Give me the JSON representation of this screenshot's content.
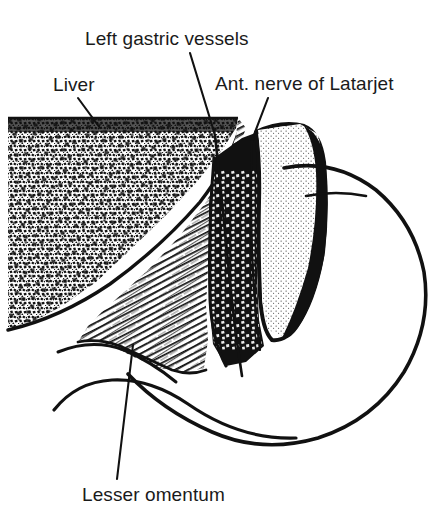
{
  "figure": {
    "background_color": "#ffffff",
    "ink_color": "#111111",
    "label_color": "#1a1a1a",
    "width": 441,
    "height": 514
  },
  "labels": [
    {
      "id": "left-gastric-vessels",
      "text": "Left gastric vessels",
      "x": 85,
      "y": 45,
      "leader": {
        "x1": 190,
        "y1": 53,
        "x2": 215,
        "y2": 135
      }
    },
    {
      "id": "liver",
      "text": "Liver",
      "x": 53,
      "y": 91,
      "leader": {
        "x1": 78,
        "y1": 98,
        "x2": 100,
        "y2": 128
      }
    },
    {
      "id": "ant-nerve-of-latarjet",
      "text": "Ant. nerve of Latarjet",
      "x": 215,
      "y": 90,
      "leader": {
        "x1": 268,
        "y1": 98,
        "x2": 252,
        "y2": 140
      }
    },
    {
      "id": "lesser-omentum",
      "text": "Lesser omentum",
      "x": 82,
      "y": 501,
      "leader": {
        "x1": 133,
        "y1": 345,
        "x2": 117,
        "y2": 479
      }
    }
  ],
  "structures": [
    {
      "id": "liver",
      "name": "Liver",
      "render": "stipple-mottled",
      "tone": "dark"
    },
    {
      "id": "lesser-omentum",
      "name": "Lesser omentum",
      "render": "fine-hatching",
      "tone": "mid"
    },
    {
      "id": "omentum-cut-edge",
      "name": "Cut edge of lesser omentum",
      "render": "light-stipple",
      "tone": "light"
    },
    {
      "id": "lesser-sac-shadow",
      "name": "Lesser sac / dark wedge",
      "render": "solid-dark",
      "tone": "black"
    },
    {
      "id": "stomach",
      "name": "Stomach",
      "render": "outline",
      "tone": "white"
    },
    {
      "id": "left-gastric-vessels",
      "name": "Left gastric vessels",
      "render": "line",
      "tone": "black"
    },
    {
      "id": "ant-nerve-of-latarjet",
      "name": "Anterior nerve of Latarjet",
      "render": "line",
      "tone": "black"
    }
  ]
}
